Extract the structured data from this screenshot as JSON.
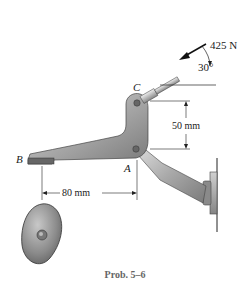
{
  "diagram": {
    "type": "statics-mechanism",
    "caption": "Prob. 5–6",
    "force": {
      "magnitude_label": "425 N",
      "angle_label": "30°"
    },
    "points": {
      "A": "A",
      "B": "B",
      "C": "C"
    },
    "dimensions": {
      "vertical": "50 mm",
      "horizontal": "80 mm"
    },
    "colors": {
      "metal_dark": "#6f6f6f",
      "metal_mid": "#a8a8a8",
      "metal_light": "#d9d9d9",
      "line": "#222222",
      "caption": "#666666"
    }
  }
}
